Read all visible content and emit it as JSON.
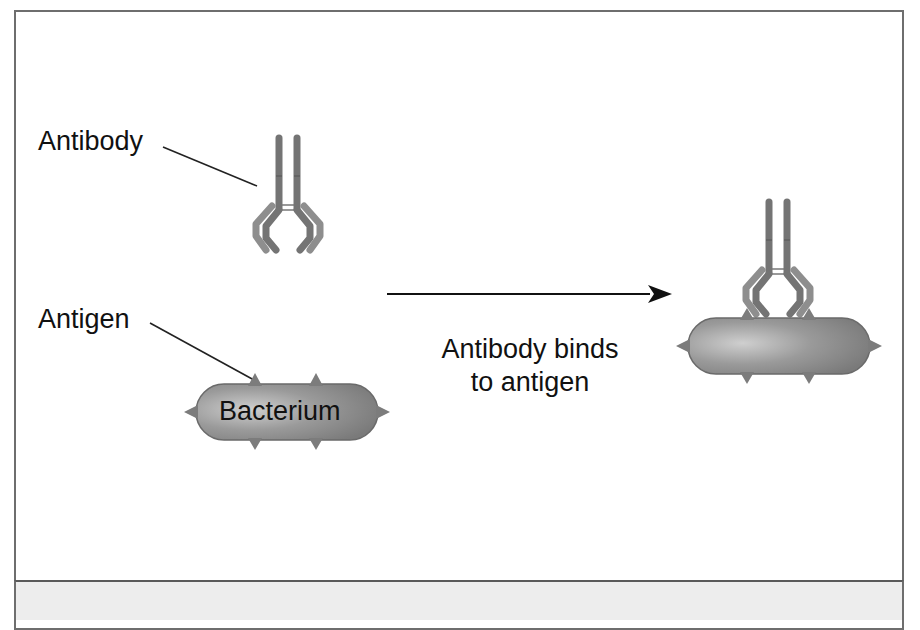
{
  "diagram": {
    "labels": {
      "antibody": "Antibody",
      "antigen": "Antigen",
      "bacterium": "Bacterium",
      "process_line1": "Antibody binds",
      "process_line2": "to antigen"
    },
    "colors": {
      "border": "#6e6e6e",
      "antibody_heavy": "#767676",
      "antibody_light": "#8c8c8c",
      "bacterium_fill": "#8a8a8a",
      "bacterium_highlight": "#c8c8c8",
      "arrow": "#111111",
      "caption_bg": "#ededed"
    }
  }
}
